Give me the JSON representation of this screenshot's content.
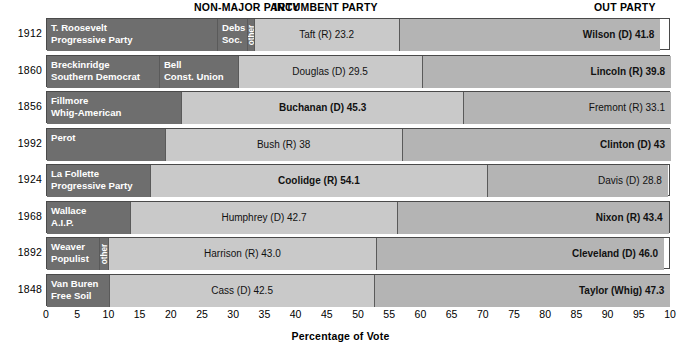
{
  "headers": {
    "nonmajor": "NON-MAJOR PARTY",
    "incumbent": "INCUMBENT PARTY",
    "out": "OUT PARTY"
  },
  "axis": {
    "title": "Percentage of Vote",
    "ticks": [
      "0",
      "5",
      "10",
      "15",
      "20",
      "25",
      "30",
      "35",
      "40",
      "45",
      "50",
      "55",
      "60",
      "65",
      "70",
      "75",
      "80",
      "85",
      "90",
      "95",
      "10"
    ]
  },
  "colors": {
    "nonmajor": "#6e6e6e",
    "incumbent": "#c9c9c9",
    "out": "#b4b4b4",
    "border": "#4a4a4a",
    "text_light": "#ffffff",
    "text_dark": "#111111"
  },
  "rows": [
    {
      "year": "1912",
      "segments": [
        {
          "kind": "nonmajor",
          "label_line1": "T. Roosevelt",
          "label_line2": "Progressive Party",
          "value": 27.4,
          "style": "left"
        },
        {
          "kind": "nonmajor",
          "label_line1": "Debs",
          "label_line2": "Soc.",
          "value": 4.8,
          "style": "left"
        },
        {
          "kind": "other",
          "label_line1": "other",
          "value": 1.1,
          "style": "vertical"
        },
        {
          "kind": "incumbent",
          "label_line1": "Taft (R) 23.2",
          "value": 23.2,
          "style": "center",
          "bold": false
        },
        {
          "kind": "out",
          "label_line1": "Wilson (D) 41.8",
          "value": 41.8,
          "style": "right",
          "bold": true
        }
      ]
    },
    {
      "year": "1860",
      "segments": [
        {
          "kind": "nonmajor",
          "label_line1": "Breckinridge",
          "label_line2": "Southern Democrat",
          "value": 18.1,
          "style": "left"
        },
        {
          "kind": "nonmajor",
          "label_line1": "Bell",
          "label_line2": "Const. Union",
          "value": 12.6,
          "style": "left"
        },
        {
          "kind": "incumbent",
          "label_line1": "Douglas (D) 29.5",
          "value": 29.5,
          "style": "center",
          "bold": false
        },
        {
          "kind": "out",
          "label_line1": "Lincoln (R) 39.8",
          "value": 39.8,
          "style": "right",
          "bold": true
        }
      ]
    },
    {
      "year": "1856",
      "segments": [
        {
          "kind": "nonmajor",
          "label_line1": "Fillmore",
          "label_line2": "Whig-American",
          "value": 21.6,
          "style": "left"
        },
        {
          "kind": "incumbent",
          "label_line1": "Buchanan (D) 45.3",
          "value": 45.3,
          "style": "center",
          "bold": true
        },
        {
          "kind": "out",
          "label_line1": "Fremont (R) 33.1",
          "value": 33.1,
          "style": "right",
          "bold": false
        }
      ]
    },
    {
      "year": "1992",
      "segments": [
        {
          "kind": "nonmajor",
          "label_line1": "Perot",
          "value": 19.0,
          "style": "left"
        },
        {
          "kind": "incumbent",
          "label_line1": "Bush (R) 38",
          "value": 38.0,
          "style": "center",
          "bold": false
        },
        {
          "kind": "out",
          "label_line1": "Clinton (D) 43",
          "value": 43.0,
          "style": "right",
          "bold": true
        }
      ]
    },
    {
      "year": "1924",
      "segments": [
        {
          "kind": "nonmajor",
          "label_line1": "La Follette",
          "label_line2": "Progressive Party",
          "value": 16.6,
          "style": "left"
        },
        {
          "kind": "incumbent",
          "label_line1": "Coolidge (R) 54.1",
          "value": 54.1,
          "style": "center",
          "bold": true
        },
        {
          "kind": "out",
          "label_line1": "Davis (D) 28.8",
          "value": 28.8,
          "style": "right",
          "bold": false
        }
      ]
    },
    {
      "year": "1968",
      "segments": [
        {
          "kind": "nonmajor",
          "label_line1": "Wallace",
          "label_line2": "A.I.P.",
          "value": 13.5,
          "style": "left"
        },
        {
          "kind": "incumbent",
          "label_line1": "Humphrey (D) 42.7",
          "value": 42.7,
          "style": "center",
          "bold": false
        },
        {
          "kind": "out",
          "label_line1": "Nixon (R) 43.4",
          "value": 43.4,
          "style": "right",
          "bold": true
        }
      ]
    },
    {
      "year": "1892",
      "segments": [
        {
          "kind": "nonmajor",
          "label_line1": "Weaver",
          "label_line2": "Populist",
          "value": 8.5,
          "style": "left"
        },
        {
          "kind": "other",
          "label_line1": "other",
          "value": 1.4,
          "style": "vertical"
        },
        {
          "kind": "incumbent",
          "label_line1": "Harrison (R) 43.0",
          "value": 43.0,
          "style": "center",
          "bold": false
        },
        {
          "kind": "out",
          "label_line1": "Cleveland (D) 46.0",
          "value": 46.0,
          "style": "right",
          "bold": true
        }
      ]
    },
    {
      "year": "1848",
      "segments": [
        {
          "kind": "nonmajor",
          "label_line1": "Van Buren",
          "label_line2": "Free Soil",
          "value": 10.1,
          "style": "left"
        },
        {
          "kind": "incumbent",
          "label_line1": "Cass (D) 42.5",
          "value": 42.5,
          "style": "center",
          "bold": false
        },
        {
          "kind": "out",
          "label_line1": "Taylor (Whig) 47.3",
          "value": 47.3,
          "style": "right",
          "bold": true
        }
      ]
    }
  ],
  "chart_data": {
    "type": "bar",
    "title": "",
    "subtitle": "",
    "xlabel": "Percentage of Vote",
    "ylabel": "",
    "xlim": [
      0,
      100
    ],
    "grid": false,
    "orientation": "horizontal",
    "stacked": true,
    "legend_position": "top",
    "legend": [
      "NON-MAJOR PARTY",
      "INCUMBENT PARTY",
      "OUT PARTY"
    ],
    "categories": [
      "1912",
      "1860",
      "1856",
      "1992",
      "1924",
      "1968",
      "1892",
      "1848"
    ],
    "stacks": [
      {
        "category": "1912",
        "parts": [
          {
            "group": "NON-MAJOR PARTY",
            "label": "T. Roosevelt Progressive Party",
            "value": 27.4
          },
          {
            "group": "NON-MAJOR PARTY",
            "label": "Debs Soc.",
            "value": 4.8
          },
          {
            "group": "NON-MAJOR PARTY",
            "label": "other",
            "value": 1.1
          },
          {
            "group": "INCUMBENT PARTY",
            "label": "Taft (R)",
            "value": 23.2
          },
          {
            "group": "OUT PARTY",
            "label": "Wilson (D)",
            "value": 41.8
          }
        ]
      },
      {
        "category": "1860",
        "parts": [
          {
            "group": "NON-MAJOR PARTY",
            "label": "Breckinridge Southern Democrat",
            "value": 18.1
          },
          {
            "group": "NON-MAJOR PARTY",
            "label": "Bell Const. Union",
            "value": 12.6
          },
          {
            "group": "INCUMBENT PARTY",
            "label": "Douglas (D)",
            "value": 29.5
          },
          {
            "group": "OUT PARTY",
            "label": "Lincoln (R)",
            "value": 39.8
          }
        ]
      },
      {
        "category": "1856",
        "parts": [
          {
            "group": "NON-MAJOR PARTY",
            "label": "Fillmore Whig-American",
            "value": 21.6
          },
          {
            "group": "INCUMBENT PARTY",
            "label": "Buchanan (D)",
            "value": 45.3
          },
          {
            "group": "OUT PARTY",
            "label": "Fremont (R)",
            "value": 33.1
          }
        ]
      },
      {
        "category": "1992",
        "parts": [
          {
            "group": "NON-MAJOR PARTY",
            "label": "Perot",
            "value": 19.0
          },
          {
            "group": "INCUMBENT PARTY",
            "label": "Bush (R)",
            "value": 38
          },
          {
            "group": "OUT PARTY",
            "label": "Clinton (D)",
            "value": 43
          }
        ]
      },
      {
        "category": "1924",
        "parts": [
          {
            "group": "NON-MAJOR PARTY",
            "label": "La Follette Progressive Party",
            "value": 16.6
          },
          {
            "group": "INCUMBENT PARTY",
            "label": "Coolidge (R)",
            "value": 54.1
          },
          {
            "group": "OUT PARTY",
            "label": "Davis (D)",
            "value": 28.8
          }
        ]
      },
      {
        "category": "1968",
        "parts": [
          {
            "group": "NON-MAJOR PARTY",
            "label": "Wallace A.I.P.",
            "value": 13.5
          },
          {
            "group": "INCUMBENT PARTY",
            "label": "Humphrey (D)",
            "value": 42.7
          },
          {
            "group": "OUT PARTY",
            "label": "Nixon (R)",
            "value": 43.4
          }
        ]
      },
      {
        "category": "1892",
        "parts": [
          {
            "group": "NON-MAJOR PARTY",
            "label": "Weaver Populist",
            "value": 8.5
          },
          {
            "group": "NON-MAJOR PARTY",
            "label": "other",
            "value": 1.4
          },
          {
            "group": "INCUMBENT PARTY",
            "label": "Harrison (R)",
            "value": 43.0
          },
          {
            "group": "OUT PARTY",
            "label": "Cleveland (D)",
            "value": 46.0
          }
        ]
      },
      {
        "category": "1848",
        "parts": [
          {
            "group": "NON-MAJOR PARTY",
            "label": "Van Buren Free Soil",
            "value": 10.1
          },
          {
            "group": "INCUMBENT PARTY",
            "label": "Cass (D)",
            "value": 42.5
          },
          {
            "group": "OUT PARTY",
            "label": "Taylor (Whig)",
            "value": 47.3
          }
        ]
      }
    ],
    "xticks": [
      0,
      5,
      10,
      15,
      20,
      25,
      30,
      35,
      40,
      45,
      50,
      55,
      60,
      65,
      70,
      75,
      80,
      85,
      90,
      95,
      100
    ]
  }
}
